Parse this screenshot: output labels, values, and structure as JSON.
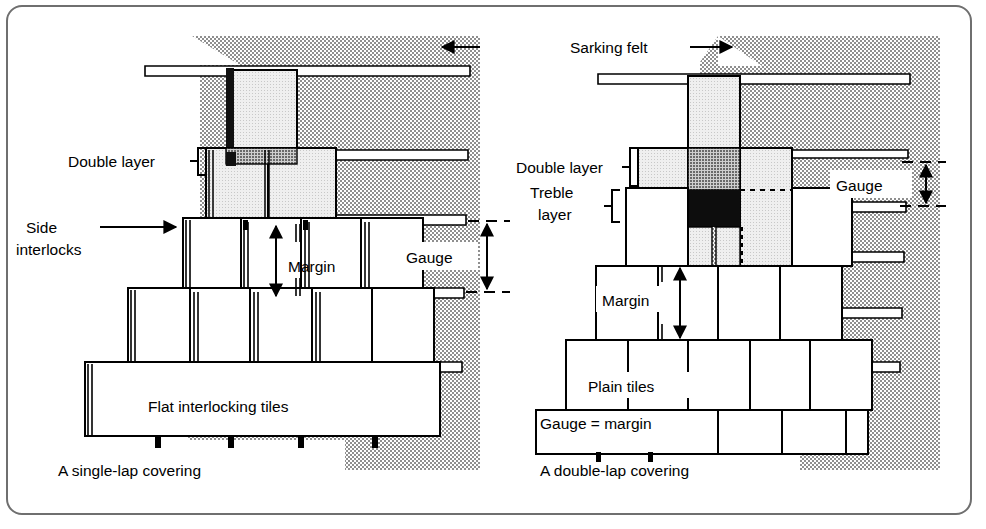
{
  "figure": {
    "kind": "roof-tiling-comparison-diagram",
    "panels": [
      {
        "id": "left-panel",
        "caption": "A single-lap covering",
        "tile_label": "Flat interlocking tiles",
        "labels": [
          {
            "name": "double-layer",
            "text": "Double layer"
          },
          {
            "name": "side-interlocks-line1",
            "text": "Side"
          },
          {
            "name": "side-interlocks-line2",
            "text": "interlocks"
          },
          {
            "name": "margin",
            "text": "Margin"
          },
          {
            "name": "gauge",
            "text": "Gauge"
          }
        ]
      },
      {
        "id": "right-panel",
        "caption": "A double-lap covering",
        "tile_label": "Plain tiles",
        "note": "Gauge = margin",
        "labels": [
          {
            "name": "double-layer",
            "text": "Double layer"
          },
          {
            "name": "treble-layer-line1",
            "text": "Treble"
          },
          {
            "name": "treble-layer-line2",
            "text": "layer"
          },
          {
            "name": "margin",
            "text": "Margin"
          },
          {
            "name": "gauge",
            "text": "Gauge"
          }
        ]
      }
    ],
    "shared_label": {
      "name": "sarking-felt",
      "text": "Sarking felt"
    },
    "arrows": [
      {
        "name": "sarking-felt-arrow-left",
        "direction": "left"
      },
      {
        "name": "sarking-felt-arrow-right",
        "direction": "right"
      }
    ],
    "colors": {
      "ink": "#000000",
      "frame": "#6f6f6f",
      "felt_hatch": "#9a9a9a",
      "tile_light": "#e6e6e6",
      "tile_mid": "#9e9e9e",
      "tile_dark": "#1a1a1a",
      "paper": "#ffffff"
    }
  }
}
